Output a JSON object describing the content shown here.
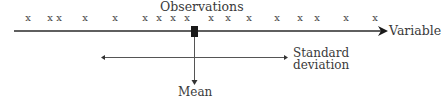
{
  "title_label": "Observations",
  "axis_label": "Variable",
  "mean_label": "Mean",
  "sd_label_line1": "Standard",
  "sd_label_line2": "deviation",
  "marker_glyph": "x",
  "colors": {
    "line": "#2a2a2a",
    "text": "#3a3a3a",
    "mean_box": "#1a1a1a"
  },
  "chart_data": {
    "type": "scatter",
    "title": "Observations",
    "xlabel": "Variable",
    "observation_pixel_x": [
      28,
      50,
      59,
      85,
      115,
      145,
      159,
      173,
      187,
      211,
      228,
      249,
      277,
      300,
      317,
      346,
      375
    ],
    "mean_pixel_x": 194,
    "sd_range_pixel_x": [
      101,
      287
    ],
    "annotations": [
      "Mean",
      "Standard deviation"
    ]
  }
}
